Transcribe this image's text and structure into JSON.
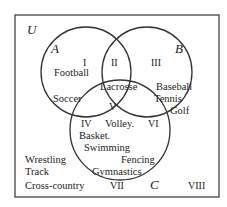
{
  "universe_label": "U",
  "sets": [
    {
      "name": "A",
      "cx": 86,
      "cy": 72,
      "r": 45
    },
    {
      "name": "B",
      "cx": 147,
      "cy": 72,
      "r": 45
    },
    {
      "name": "C",
      "cx": 120,
      "cy": 130,
      "r": 50
    }
  ],
  "regions": [
    {
      "numeral": "I",
      "items": [
        "Football",
        "Soccer"
      ]
    },
    {
      "numeral": "II",
      "items": [
        "Lacrosse"
      ]
    },
    {
      "numeral": "III",
      "items": [
        "Baseball",
        "Tennis",
        "Golf"
      ]
    },
    {
      "numeral": "IV",
      "items": [
        "Basket."
      ]
    },
    {
      "numeral": "V",
      "items": [
        "Volley."
      ]
    },
    {
      "numeral": "VI",
      "items": []
    },
    {
      "numeral": "VII",
      "items": [
        "Swimming",
        "Fencing",
        "Gymnastics"
      ]
    },
    {
      "numeral": "VIII",
      "items": [
        "Wrestling",
        "Track",
        "Cross-country"
      ]
    }
  ],
  "labels": {
    "U": "U",
    "A": "A",
    "B": "B",
    "C": "C",
    "I": "I",
    "II": "II",
    "III": "III",
    "IV": "IV",
    "V": "V",
    "VI": "VI",
    "VII": "VII",
    "VIII": "VIII",
    "football": "Football",
    "soccer": "Soccer",
    "lacrosse": "Lacrosse",
    "baseball": "Baseball",
    "tennis": "Tennis",
    "golf": "Golf",
    "volley": "Volley.",
    "basket": "Basket.",
    "swimming": "Swimming",
    "fencing": "Fencing",
    "gymnastics": "Gymnastics",
    "wrestling": "Wrestling",
    "track": "Track",
    "cross_country": "Cross-country"
  }
}
